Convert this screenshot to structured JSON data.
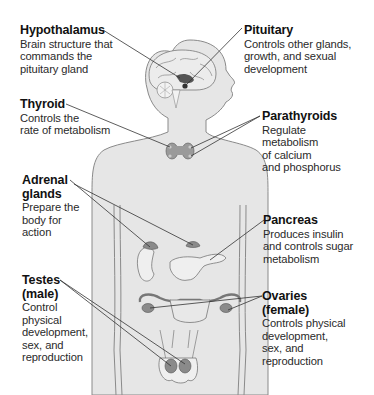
{
  "diagram": {
    "colors": {
      "body_fill": "#e6e6e6",
      "body_outline": "#8a8a8a",
      "gland_fill": "#9a9a9a",
      "gland_dark": "#555555",
      "leader_line": "#333333",
      "text": "#1a1a1a"
    },
    "labels": [
      {
        "id": "hypothalamus",
        "title": "Hypothalamus",
        "lines": [
          "Brain structure that",
          "commands the",
          "pituitary gland"
        ]
      },
      {
        "id": "pituitary",
        "title": "Pituitary",
        "lines": [
          "Controls other glands,",
          "growth, and sexual",
          "development"
        ]
      },
      {
        "id": "thyroid",
        "title": "Thyroid",
        "lines": [
          "Controls the",
          "rate of metabolism"
        ]
      },
      {
        "id": "parathyroids",
        "title": "Parathyroids",
        "lines": [
          "Regulate",
          "metabolism",
          "of calcium",
          "and phosphorus"
        ]
      },
      {
        "id": "adrenal",
        "title_lines": [
          "Adrenal",
          "glands"
        ],
        "lines": [
          "Prepare the",
          "body for",
          "action"
        ]
      },
      {
        "id": "pancreas",
        "title": "Pancreas",
        "lines": [
          "Produces insulin",
          "and controls sugar",
          "metabolism"
        ]
      },
      {
        "id": "testes",
        "title_lines": [
          "Testes",
          "(male)"
        ],
        "lines": [
          "Control",
          "physical",
          "development,",
          "sex, and",
          "reproduction"
        ]
      },
      {
        "id": "ovaries",
        "title_lines": [
          "Ovaries",
          "(female)"
        ],
        "lines": [
          "Controls physical",
          "development,",
          "sex, and",
          "reproduction"
        ]
      }
    ]
  }
}
